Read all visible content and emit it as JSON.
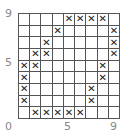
{
  "axis_labels": {
    "y_top": "9",
    "y_mid": "5",
    "x_origin": "0",
    "x_mid": "5",
    "x_end": "9"
  },
  "grid": {
    "rows": 9,
    "cols": 9,
    "mark_symbol": "✕",
    "cells": [
      [
        "",
        "",
        "",
        "",
        "X",
        "X",
        "X",
        "X",
        ""
      ],
      [
        "",
        "",
        "",
        "X",
        "",
        "",
        "",
        "",
        "X"
      ],
      [
        "",
        "",
        "X",
        "",
        "",
        "",
        "",
        "",
        "X"
      ],
      [
        "",
        "X",
        "X",
        "",
        "",
        "",
        "",
        "",
        "X"
      ],
      [
        "X",
        "X",
        "",
        "",
        "",
        "",
        "",
        "X",
        ""
      ],
      [
        "X",
        "",
        "",
        "",
        "",
        "",
        "",
        "X",
        ""
      ],
      [
        "X",
        "",
        "",
        "",
        "",
        "",
        "X",
        "",
        ""
      ],
      [
        "X",
        "",
        "",
        "",
        "",
        "",
        "X",
        "",
        ""
      ],
      [
        "",
        "X",
        "X",
        "X",
        "X",
        "X",
        "",
        "",
        ""
      ]
    ]
  }
}
